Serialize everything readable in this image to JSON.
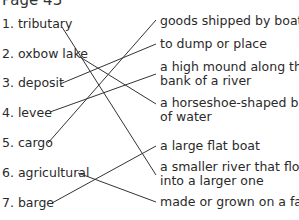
{
  "title": "Page 43",
  "terms": [
    {
      "label": "1. tributary"
    },
    {
      "label": "2. oxbow lake"
    },
    {
      "label": "3. deposit"
    },
    {
      "label": "4. levee"
    },
    {
      "label": "5. cargo"
    },
    {
      "label": "6. agricultural"
    },
    {
      "label": "7.  barge"
    }
  ],
  "definitions": [
    {
      "line1": "goods shipped by boat",
      "line2": ""
    },
    {
      "line1": "to dump or place",
      "line2": ""
    },
    {
      "line1": "a high mound along the",
      "line2": "bank of a river"
    },
    {
      "line1": "a horseshoe-shaped body",
      "line2": "of water"
    },
    {
      "line1": "a large flat boat",
      "line2": ""
    },
    {
      "line1": "a smaller river that flows",
      "line2": "into a larger one"
    },
    {
      "line1": "made or grown on a farm",
      "line2": ""
    }
  ],
  "matches": [
    {
      "term": "tributary",
      "definition": "a smaller river that flows into a larger one"
    },
    {
      "term": "oxbow lake",
      "definition": "a horseshoe-shaped body of water"
    },
    {
      "term": "deposit",
      "definition": "to dump or place"
    },
    {
      "term": "levee",
      "definition": "a high mound along the bank of a river"
    },
    {
      "term": "cargo",
      "definition": "goods shipped by boat"
    },
    {
      "term": "agricultural",
      "definition": "made or grown on a farm"
    },
    {
      "term": "barge",
      "definition": "a large flat boat"
    }
  ],
  "line_color": "#333333"
}
